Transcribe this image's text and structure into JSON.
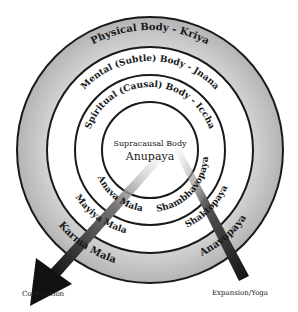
{
  "diagram": {
    "rings": [
      {
        "id": "physical",
        "label": "Physical Body - Kriya"
      },
      {
        "id": "mental",
        "label": "Mental (Subtle) Body - Jnana"
      },
      {
        "id": "spiritual",
        "label": "Spiritual (Causal) Body - Iccha"
      }
    ],
    "center": {
      "title": "Supracausal Body",
      "subtitle": "Anupaya"
    },
    "left_labels": [
      "Anava Mala",
      "Mayiya Mala",
      "Karma Mala"
    ],
    "right_labels": [
      "Shambhavopaya",
      "Shaktopaya",
      "Anavopaya"
    ],
    "arrows": {
      "left": "Contraction",
      "right": "Expansion/Yoga"
    },
    "colors": {
      "ink": "#1a1a1a",
      "outer_ring_fill": "#c8c8c8",
      "background": "#ffffff"
    }
  }
}
